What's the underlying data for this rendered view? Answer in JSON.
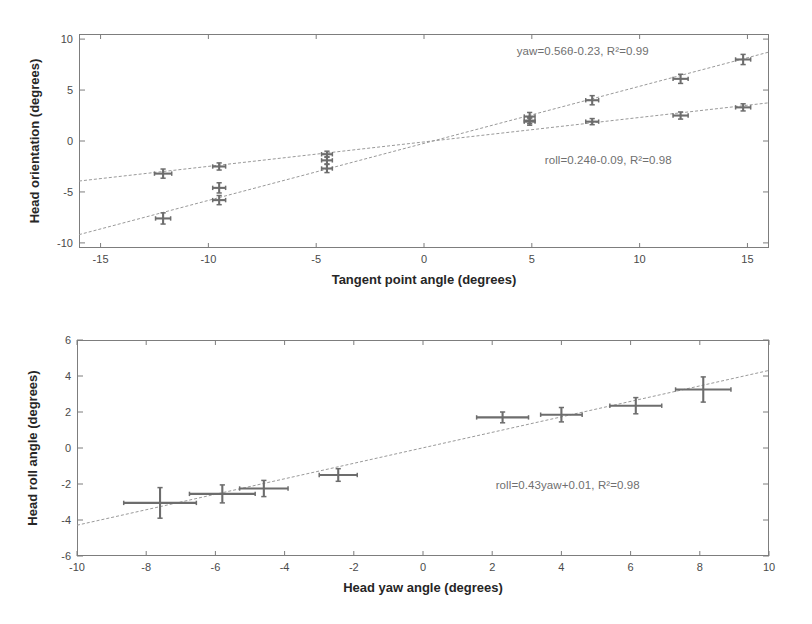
{
  "figure": {
    "panel_count": 2,
    "background": "#ffffff",
    "marker_color": "#6d6d6d",
    "fit_line_color": "#9a9a9a",
    "axis_color": "#7d7d7d"
  },
  "chart_data": [
    {
      "id": "top-panel",
      "type": "scatter",
      "title": "",
      "xlabel": "Tangent point angle (degrees)",
      "ylabel": "Head orientation (degrees)",
      "xlim": [
        -16,
        16
      ],
      "ylim": [
        -10.5,
        10.5
      ],
      "xticks": [
        -15,
        -10,
        -5,
        0,
        5,
        10,
        15
      ],
      "yticks": [
        10,
        5,
        0,
        -5,
        -10
      ],
      "grid": false,
      "legend": "none",
      "annotations": [
        {
          "name": "yaw-fit-equation",
          "text": "yaw=0.56θ-0.23, R²=0.99",
          "x": 4.3,
          "y": 8.6
        },
        {
          "name": "roll-fit-equation",
          "text": "roll=0.24θ-0.09, R²=0.98",
          "x": 5.6,
          "y": -2.1
        }
      ],
      "series": [
        {
          "name": "yaw",
          "slope": 0.56,
          "intercept": -0.23,
          "r2": 0.99,
          "points": [
            {
              "x": -12.1,
              "y": -7.6,
              "yerr": 0.55,
              "xerr": 0.35
            },
            {
              "x": -9.5,
              "y": -5.8,
              "yerr": 0.45,
              "xerr": 0.3
            },
            {
              "x": -9.5,
              "y": -4.6,
              "yerr": 0.5,
              "xerr": 0.3
            },
            {
              "x": -4.5,
              "y": -2.7,
              "yerr": 0.4,
              "xerr": 0.25
            },
            {
              "x": -4.5,
              "y": -1.9,
              "yerr": 0.35,
              "xerr": 0.25
            },
            {
              "x": 4.9,
              "y": 2.4,
              "yerr": 0.4,
              "xerr": 0.25
            },
            {
              "x": 4.9,
              "y": 1.9,
              "yerr": 0.35,
              "xerr": 0.25
            },
            {
              "x": 7.8,
              "y": 4.0,
              "yerr": 0.45,
              "xerr": 0.3
            },
            {
              "x": 11.9,
              "y": 6.1,
              "yerr": 0.45,
              "xerr": 0.35
            },
            {
              "x": 14.8,
              "y": 8.0,
              "yerr": 0.5,
              "xerr": 0.35
            }
          ]
        },
        {
          "name": "roll",
          "slope": 0.24,
          "intercept": -0.09,
          "r2": 0.98,
          "points": [
            {
              "x": -12.1,
              "y": -3.2,
              "yerr": 0.45,
              "xerr": 0.4
            },
            {
              "x": -9.5,
              "y": -2.5,
              "yerr": 0.35,
              "xerr": 0.3
            },
            {
              "x": -4.5,
              "y": -1.3,
              "yerr": 0.3,
              "xerr": 0.25
            },
            {
              "x": 4.9,
              "y": 2.0,
              "yerr": 0.3,
              "xerr": 0.25
            },
            {
              "x": 7.8,
              "y": 1.9,
              "yerr": 0.3,
              "xerr": 0.3
            },
            {
              "x": 11.9,
              "y": 2.5,
              "yerr": 0.35,
              "xerr": 0.35
            },
            {
              "x": 14.8,
              "y": 3.3,
              "yerr": 0.35,
              "xerr": 0.35
            }
          ]
        }
      ]
    },
    {
      "id": "bottom-panel",
      "type": "scatter",
      "title": "",
      "xlabel": "Head yaw angle (degrees)",
      "ylabel": "Head roll angle (degrees)",
      "xlim": [
        -10,
        10
      ],
      "ylim": [
        -6,
        6
      ],
      "xticks": [
        -10,
        -8,
        -6,
        -4,
        -2,
        0,
        2,
        4,
        6,
        8,
        10
      ],
      "yticks": [
        6,
        4,
        2,
        0,
        -2,
        -4,
        -6
      ],
      "grid": false,
      "legend": "none",
      "annotations": [
        {
          "name": "roll-yaw-fit-equation",
          "text": "roll=0.43yaw+0.01, R²=0.98",
          "x": 2.1,
          "y": -2.15
        }
      ],
      "series": [
        {
          "name": "roll-vs-yaw",
          "slope": 0.43,
          "intercept": 0.01,
          "r2": 0.98,
          "points": [
            {
              "x": -7.6,
              "y": -3.05,
              "yerr": 0.85,
              "xerr": 1.05
            },
            {
              "x": -5.8,
              "y": -2.55,
              "yerr": 0.5,
              "xerr": 0.95
            },
            {
              "x": -4.6,
              "y": -2.25,
              "yerr": 0.45,
              "xerr": 0.7
            },
            {
              "x": -2.45,
              "y": -1.5,
              "yerr": 0.35,
              "xerr": 0.55
            },
            {
              "x": 2.3,
              "y": 1.7,
              "yerr": 0.3,
              "xerr": 0.75
            },
            {
              "x": 4.0,
              "y": 1.85,
              "yerr": 0.4,
              "xerr": 0.6
            },
            {
              "x": 6.15,
              "y": 2.35,
              "yerr": 0.45,
              "xerr": 0.75
            },
            {
              "x": 8.1,
              "y": 3.25,
              "yerr": 0.7,
              "xerr": 0.8
            }
          ]
        }
      ]
    }
  ]
}
